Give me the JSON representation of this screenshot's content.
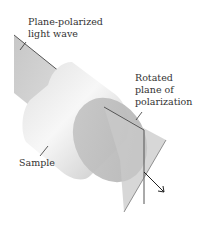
{
  "diagram": {
    "type": "optical-rotation-illustration",
    "labels": {
      "incident_wave": [
        "Plane-polarized",
        "light wave"
      ],
      "rotated_plane": [
        "Rotated",
        "plane of",
        "polarization"
      ],
      "sample": "Sample"
    },
    "colors": {
      "plane_fill": "#c9c9c9",
      "plane_edge": "#555555",
      "cylinder_light": "#f2f2f2",
      "cylinder_shade": "#bdbdbd",
      "text": "#333333",
      "arrow": "#222222"
    }
  }
}
